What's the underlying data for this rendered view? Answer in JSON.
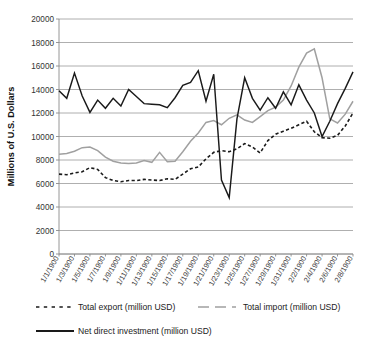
{
  "chart_data": {
    "type": "line",
    "title": "",
    "xlabel": "",
    "ylabel": "Millions of U.S. Dollars",
    "ylim": [
      0,
      20000
    ],
    "ytick_step": 2000,
    "yticks": [
      "0",
      "2000",
      "4000",
      "6000",
      "8000",
      "10000",
      "12000",
      "14000",
      "16000",
      "18000",
      "20000"
    ],
    "grid": true,
    "legend_position": "bottom",
    "x_tick_labels": [
      "1/1/1900",
      "1/3/1900",
      "1/5/1900",
      "1/7/1900",
      "1/9/1900",
      "1/11/1900",
      "1/13/1900",
      "1/15/1900",
      "1/17/1900",
      "1/19/1900",
      "1/21/1900",
      "1/23/1900",
      "1/25/1900",
      "1/27/1900",
      "1/29/1900",
      "1/31/1900",
      "2/2/1900",
      "2/4/1900",
      "2/6/1900",
      "2/8/1900"
    ],
    "x": [
      1,
      2,
      3,
      4,
      5,
      6,
      7,
      8,
      9,
      10,
      11,
      12,
      13,
      14,
      15,
      16,
      17,
      18,
      19,
      20,
      21,
      22,
      23,
      24,
      25,
      26,
      27,
      28,
      29,
      30,
      31,
      32,
      33,
      34,
      35,
      36,
      37,
      38,
      39
    ],
    "series": [
      {
        "name": "Total export (million USD)",
        "color": "#1a1a1a",
        "style": "dashed",
        "values": [
          6800,
          6750,
          6900,
          7000,
          7350,
          7200,
          6500,
          6250,
          6150,
          6250,
          6250,
          6350,
          6300,
          6250,
          6400,
          6350,
          6800,
          7250,
          7400,
          8100,
          8650,
          8800,
          8700,
          8950,
          9400,
          9100,
          8600,
          9650,
          10200,
          10450,
          10700,
          11000,
          11300,
          10400,
          9900,
          9850,
          10100,
          10900,
          12000
        ]
      },
      {
        "name": "Total import (million USD)",
        "color": "#a0a0a0",
        "style": "solid-gray",
        "values": [
          8500,
          8550,
          8750,
          9050,
          9100,
          8800,
          8250,
          7900,
          7750,
          7700,
          7750,
          7950,
          7800,
          8650,
          7850,
          7900,
          8700,
          9600,
          10300,
          11200,
          11350,
          11000,
          11550,
          11850,
          11400,
          11200,
          11700,
          12200,
          12500,
          13100,
          14300,
          15900,
          17100,
          17450,
          15000,
          11500,
          11150,
          11900,
          13000
        ]
      },
      {
        "name": "Net direct investment (million USD)",
        "color": "#1a1a1a",
        "style": "solid",
        "values": [
          13900,
          13250,
          15400,
          13450,
          12050,
          13100,
          12400,
          13250,
          12600,
          14000,
          13400,
          12800,
          12750,
          12700,
          12450,
          13300,
          14350,
          14600,
          15600,
          13000,
          15300,
          6300,
          4800,
          11500,
          15000,
          13250,
          12250,
          13300,
          12400,
          13800,
          12700,
          14400,
          13100,
          12000,
          10000,
          11300,
          12800,
          14100,
          15500
        ]
      }
    ]
  },
  "legend": {
    "items": [
      {
        "label": "Total export (million USD)",
        "style": "dashed",
        "color": "#1a1a1a"
      },
      {
        "label": "Total import (million USD)",
        "style": "solid-gray",
        "color": "#a0a0a0"
      },
      {
        "label": "Net direct investment (million USD)",
        "style": "solid",
        "color": "#1a1a1a"
      }
    ]
  }
}
